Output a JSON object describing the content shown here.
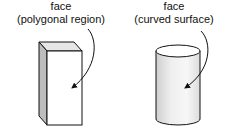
{
  "figures": [
    {
      "shape": "rectangular-prism",
      "label_line1": "face",
      "label_line2": "(polygonal region)"
    },
    {
      "shape": "cylinder",
      "label_line1": "face",
      "label_line2": "(curved surface)"
    }
  ]
}
